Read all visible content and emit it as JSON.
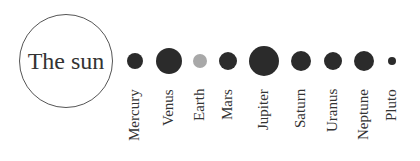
{
  "sun": {
    "label": "The sun"
  },
  "colors": {
    "planet": "#2b2b2b",
    "earth": "#a8a8a8",
    "outline": "#555555",
    "text": "#333333"
  },
  "planets": [
    {
      "name": "Mercury",
      "cx": 135,
      "r": 8,
      "color": "#2b2b2b"
    },
    {
      "name": "Venus",
      "cx": 169,
      "r": 13,
      "color": "#2b2b2b"
    },
    {
      "name": "Earth",
      "cx": 200,
      "r": 7,
      "color": "#a8a8a8"
    },
    {
      "name": "Mars",
      "cx": 228,
      "r": 9,
      "color": "#2b2b2b"
    },
    {
      "name": "Jupiter",
      "cx": 264,
      "r": 15,
      "color": "#2b2b2b"
    },
    {
      "name": "Saturn",
      "cx": 301,
      "r": 10,
      "color": "#2b2b2b"
    },
    {
      "name": "Uranus",
      "cx": 333,
      "r": 9,
      "color": "#2b2b2b"
    },
    {
      "name": "Neptune",
      "cx": 364,
      "r": 10,
      "color": "#2b2b2b"
    },
    {
      "name": "Pluto",
      "cx": 392,
      "r": 4,
      "color": "#2b2b2b"
    }
  ]
}
